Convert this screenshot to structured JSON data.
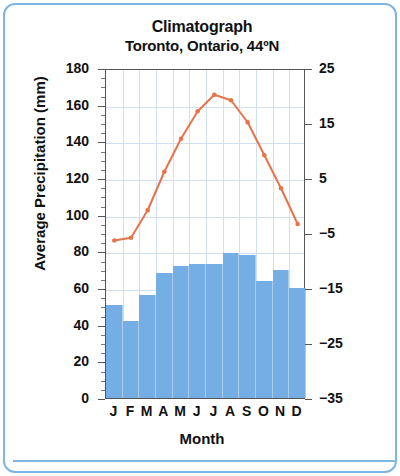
{
  "chart_data": {
    "type": "bar",
    "title": "Climatograph",
    "subtitle": "Toronto, Ontario, 44ºN",
    "xlabel": "Month",
    "ylabel": "Average Precipitation (mm)",
    "y2label": "Average Temperature (ºC)",
    "categories": [
      "J",
      "F",
      "M",
      "A",
      "M",
      "J",
      "J",
      "A",
      "S",
      "O",
      "N",
      "D"
    ],
    "ylim": [
      0,
      180
    ],
    "yticks": [
      0,
      20,
      40,
      60,
      80,
      100,
      120,
      140,
      160,
      180
    ],
    "y2lim": [
      -35,
      25
    ],
    "y2ticks": [
      -35,
      -25,
      -15,
      -5,
      5,
      15,
      25
    ],
    "grid": true,
    "legend": "none",
    "series": [
      {
        "name": "Average Precipitation (mm)",
        "type": "bar",
        "axis": "left",
        "color": "#74aee4",
        "values": [
          51,
          42,
          56,
          68,
          72,
          73,
          73,
          79,
          78,
          64,
          70,
          60
        ]
      },
      {
        "name": "Average Temperature (ºC)",
        "type": "line",
        "axis": "right",
        "color": "#e8734a",
        "values": [
          -6.0,
          -5.5,
          -0.5,
          6.5,
          12.5,
          17.5,
          20.5,
          19.5,
          15.5,
          9.5,
          3.5,
          -3.0
        ]
      }
    ]
  },
  "axes": {
    "left_tick_labels": [
      "180",
      "160",
      "140",
      "120",
      "100",
      "80",
      "60",
      "40",
      "20",
      "0"
    ],
    "right_tick_labels": [
      "25",
      "15",
      "5",
      "−5",
      "−15",
      "−25",
      "−35"
    ]
  }
}
